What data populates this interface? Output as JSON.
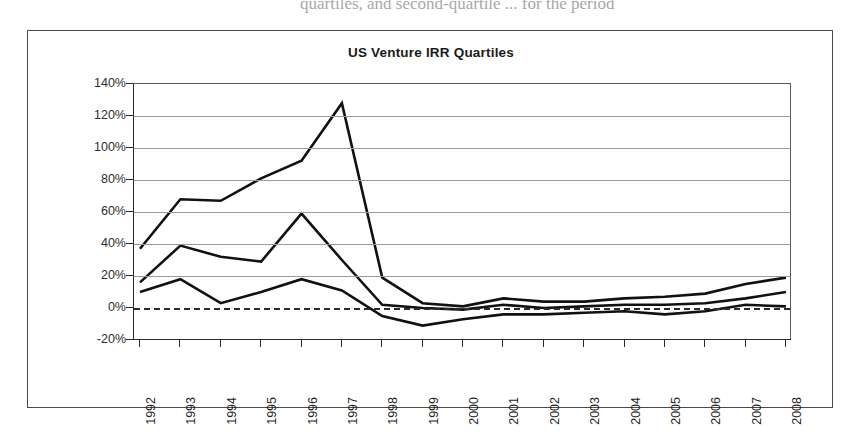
{
  "page": {
    "scan_header_text": "quartiles, and second-quartile  ...  for the period"
  },
  "figure": {
    "frame_label": "chart-frame"
  },
  "chart_data": {
    "type": "line",
    "title": "US Venture IRR Quartiles",
    "xlabel": "",
    "ylabel": "",
    "grid": true,
    "legend": "none",
    "ylim": [
      -20,
      140
    ],
    "ytick_labels": [
      "140%",
      "120%",
      "100%",
      "80%",
      "60%",
      "40%",
      "20%",
      "0%",
      "-20%"
    ],
    "ytick_values": [
      140,
      120,
      100,
      80,
      60,
      40,
      20,
      0,
      -20
    ],
    "categories": [
      "1992",
      "1993",
      "1994",
      "1995",
      "1996",
      "1997",
      "1998",
      "1999",
      "2000",
      "2001",
      "2002",
      "2003",
      "2004",
      "2005",
      "2006",
      "2007",
      "2008"
    ],
    "zero_reference_line": 0,
    "series": [
      {
        "name": "Upper Quartile",
        "values": [
          37,
          68,
          67,
          81,
          92,
          128,
          19,
          3,
          1,
          6,
          4,
          4,
          6,
          7,
          9,
          15,
          19
        ]
      },
      {
        "name": "Median",
        "values": [
          16,
          39,
          32,
          29,
          59,
          30,
          2,
          0,
          -1,
          2,
          0,
          1,
          2,
          2,
          3,
          6,
          10
        ]
      },
      {
        "name": "Lower Quartile",
        "values": [
          10,
          18,
          3,
          10,
          18,
          11,
          -5,
          -11,
          -7,
          -4,
          -4,
          -3,
          -2,
          -4,
          -2,
          2,
          1
        ]
      }
    ]
  }
}
